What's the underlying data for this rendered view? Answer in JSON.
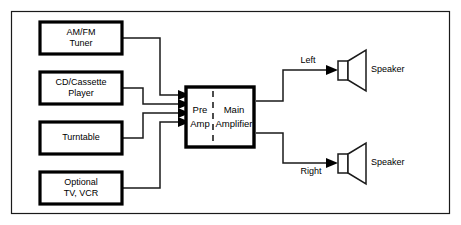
{
  "diagram": {
    "type": "block-diagram",
    "colors": {
      "background": "#ffffff",
      "line": "#1a1a1a",
      "box_border": "#000000",
      "text": "#000000"
    },
    "sources": [
      {
        "id": "am-fm-tuner",
        "line1": "AM/FM",
        "line2": "Tuner",
        "connects_to": "pre-amp-input-1"
      },
      {
        "id": "cd-cassette-player",
        "line1": "CD/Cassette",
        "line2": "Player",
        "connects_to": "pre-amp-input-2"
      },
      {
        "id": "turntable",
        "line1": "Turntable",
        "line2": "",
        "connects_to": "pre-amp-input-3"
      },
      {
        "id": "optional-tv-vcr",
        "line1": "Optional",
        "line2": "TV, VCR",
        "connects_to": "pre-amp-input-4"
      }
    ],
    "amplifier": {
      "id": "amplifier-unit",
      "pre_amp": {
        "line1": "Pre",
        "line2": "Amp"
      },
      "main_amp": {
        "line1": "Main",
        "line2": "Amplifier"
      },
      "input_count": 4,
      "output_count": 2
    },
    "outputs": [
      {
        "id": "left-channel",
        "channel_label": "Left",
        "device_label": "Speaker",
        "icon": "speaker-icon"
      },
      {
        "id": "right-channel",
        "channel_label": "Right",
        "device_label": "Speaker",
        "icon": "speaker-icon"
      }
    ]
  }
}
